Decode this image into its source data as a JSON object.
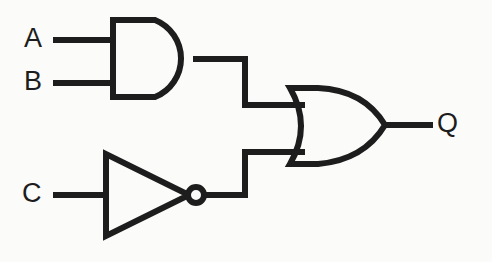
{
  "diagram": {
    "kind": "logic-gate-schematic",
    "expression": "Q = (A AND B) OR (NOT C)",
    "stroke_color": "#1d1d1d",
    "background_color": "#fbfbfa",
    "stroke_width": 6
  },
  "inputs": [
    {
      "id": "A",
      "label": "A",
      "wire_y": 40
    },
    {
      "id": "B",
      "label": "B",
      "wire_y": 83
    },
    {
      "id": "C",
      "label": "C",
      "wire_y": 195
    }
  ],
  "outputs": [
    {
      "id": "Q",
      "label": "Q",
      "wire_y": 125
    }
  ],
  "gates": [
    {
      "id": "and1",
      "type": "AND",
      "symbol_name": "and-gate",
      "inputs": [
        "A",
        "B"
      ],
      "output": "and1_out",
      "x": 110,
      "y": 17,
      "width": 86,
      "height": 83
    },
    {
      "id": "not1",
      "type": "NOT",
      "symbol_name": "not-gate",
      "inputs": [
        "C"
      ],
      "output": "not1_out",
      "has_bubble": true,
      "x": 103,
      "y": 152,
      "width": 84,
      "height": 86
    },
    {
      "id": "or1",
      "type": "OR",
      "symbol_name": "or-gate",
      "inputs": [
        "and1_out",
        "not1_out"
      ],
      "output": "Q",
      "x": 288,
      "y": 85,
      "width": 97,
      "height": 82
    }
  ],
  "wires": [
    {
      "id": "wire-a-in",
      "from": "A",
      "to": "and1",
      "points": "56,40 110,40"
    },
    {
      "id": "wire-b-in",
      "from": "B",
      "to": "and1",
      "points": "56,83 110,83"
    },
    {
      "id": "wire-c-in",
      "from": "C",
      "to": "not1",
      "points": "56,195 103,195"
    },
    {
      "id": "wire-and-to-or",
      "from": "and1",
      "to": "or1",
      "points": "196,59 245,59 245,105 300,105"
    },
    {
      "id": "wire-not-to-or",
      "from": "not1",
      "to": "or1",
      "points": "203,195 245,195 245,152 300,152"
    },
    {
      "id": "wire-or-out",
      "from": "or1",
      "to": "Q",
      "points": "385,125 428,125"
    }
  ]
}
